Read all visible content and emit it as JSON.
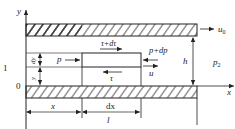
{
  "diagram": {
    "axes": {
      "y_label": "y",
      "x_label": "x"
    },
    "left_labels": {
      "one": "1",
      "zero": "0"
    },
    "top_plate": {
      "velocity_label": "u",
      "velocity_sub": "0"
    },
    "gap_label": "h",
    "outlet_pressure": {
      "label": "p",
      "sub": "2"
    },
    "element": {
      "top_shear": "τ+dτ",
      "bottom_shear": "τ",
      "left_pressure": "p",
      "right_pressure": "p+dp",
      "velocity": "u",
      "height_label": "dy",
      "y_label": "y"
    },
    "dimensions": {
      "x": "x",
      "dx": "dx",
      "l": "l"
    },
    "colors": {
      "line": "#222222",
      "background": "#ffffff"
    }
  }
}
